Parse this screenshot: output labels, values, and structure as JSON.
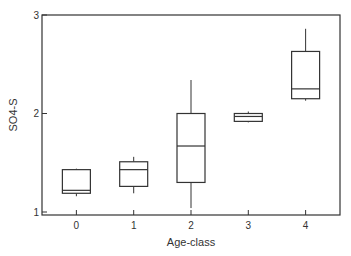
{
  "chart_data": {
    "type": "box",
    "title": "",
    "xlabel": "Age-class",
    "ylabel": "SO4-S",
    "categories": [
      "0",
      "1",
      "2",
      "3",
      "4"
    ],
    "yticks": [
      "1",
      "2",
      "3"
    ],
    "ylim": [
      1,
      3
    ],
    "xlim": [
      -0.6,
      4.6
    ],
    "grid": false,
    "legend": "none",
    "boxes": [
      {
        "category": "0",
        "whisker_low": 1.16,
        "q1": 1.19,
        "median": 1.22,
        "q3": 1.43,
        "whisker_high": 1.44
      },
      {
        "category": "1",
        "whisker_low": 1.19,
        "q1": 1.26,
        "median": 1.43,
        "q3": 1.51,
        "whisker_high": 1.56
      },
      {
        "category": "2",
        "whisker_low": 1.04,
        "q1": 1.3,
        "median": 1.67,
        "q3": 2.0,
        "whisker_high": 2.34
      },
      {
        "category": "3",
        "whisker_low": 1.91,
        "q1": 1.92,
        "median": 1.97,
        "q3": 2.0,
        "whisker_high": 2.02
      },
      {
        "category": "4",
        "whisker_low": 2.13,
        "q1": 2.15,
        "median": 2.25,
        "q3": 2.63,
        "whisker_high": 2.86
      }
    ]
  }
}
